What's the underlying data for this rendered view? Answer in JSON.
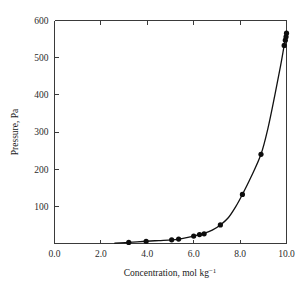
{
  "chart_data": {
    "type": "scatter",
    "title": "",
    "xlabel": "Concentration, mol kg⁻¹",
    "ylabel": "Pressure, Pa",
    "xlim": [
      0.0,
      10.0
    ],
    "ylim": [
      0,
      600
    ],
    "grid": false,
    "legend": null,
    "xticks": [
      0.0,
      2.0,
      4.0,
      6.0,
      8.0,
      10.0
    ],
    "xtick_labels": [
      "0.0",
      "2.0",
      "4.0",
      "6.0",
      "8.0",
      "10.0"
    ],
    "yticks": [
      0,
      100,
      200,
      300,
      400,
      500,
      600
    ],
    "ytick_labels": [
      "",
      "100",
      "200",
      "300",
      "400",
      "500",
      "600"
    ],
    "series": [
      {
        "name": "measured points",
        "marker": "filled-circle",
        "color": "#0d0d0d",
        "points": [
          {
            "x": 3.2,
            "y": 3
          },
          {
            "x": 3.95,
            "y": 6
          },
          {
            "x": 5.05,
            "y": 10
          },
          {
            "x": 5.35,
            "y": 12
          },
          {
            "x": 6.0,
            "y": 20
          },
          {
            "x": 6.25,
            "y": 24
          },
          {
            "x": 6.45,
            "y": 26
          },
          {
            "x": 7.15,
            "y": 50
          },
          {
            "x": 8.1,
            "y": 132
          },
          {
            "x": 8.9,
            "y": 240
          },
          {
            "x": 9.9,
            "y": 533
          },
          {
            "x": 9.95,
            "y": 547
          },
          {
            "x": 9.98,
            "y": 556
          },
          {
            "x": 10.0,
            "y": 566
          }
        ]
      },
      {
        "name": "fitted curve",
        "marker": "none",
        "color": "#111111",
        "points": [
          {
            "x": 2.6,
            "y": 1
          },
          {
            "x": 3.2,
            "y": 3
          },
          {
            "x": 3.95,
            "y": 6
          },
          {
            "x": 4.5,
            "y": 8
          },
          {
            "x": 5.05,
            "y": 10
          },
          {
            "x": 5.35,
            "y": 12
          },
          {
            "x": 5.7,
            "y": 16
          },
          {
            "x": 6.0,
            "y": 20
          },
          {
            "x": 6.25,
            "y": 24
          },
          {
            "x": 6.45,
            "y": 27
          },
          {
            "x": 6.8,
            "y": 36
          },
          {
            "x": 7.15,
            "y": 50
          },
          {
            "x": 7.5,
            "y": 70
          },
          {
            "x": 7.8,
            "y": 98
          },
          {
            "x": 8.1,
            "y": 132
          },
          {
            "x": 8.45,
            "y": 176
          },
          {
            "x": 8.9,
            "y": 240
          },
          {
            "x": 9.2,
            "y": 310
          },
          {
            "x": 9.5,
            "y": 400
          },
          {
            "x": 9.75,
            "y": 480
          },
          {
            "x": 9.9,
            "y": 533
          },
          {
            "x": 10.0,
            "y": 566
          }
        ]
      }
    ]
  },
  "axis": {
    "x_label_main": "Concentration, mol kg",
    "x_label_exponent": "−1",
    "y_label": "Pressure, Pa"
  }
}
